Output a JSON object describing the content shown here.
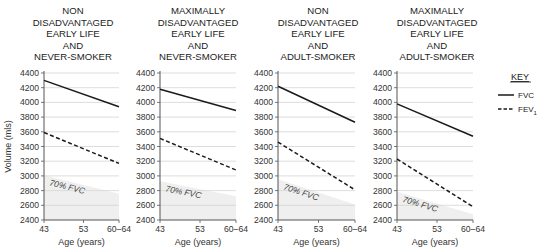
{
  "chart_data": [
    {
      "type": "line",
      "title": "NON DISADVANTAGED EARLY LIFE AND NEVER-SMOKER",
      "title_lines": [
        "NON",
        "DISADVANTAGED",
        "EARLY LIFE",
        "AND",
        "NEVER-SMOKER"
      ],
      "xlabel": "Age (years)",
      "ylabel": "Volume (mls)",
      "categories": [
        "43",
        "53",
        "60–64"
      ],
      "ylim": [
        2400,
        4400
      ],
      "yticks": [
        2400,
        2600,
        2800,
        3000,
        3200,
        3400,
        3600,
        3800,
        4000,
        4200,
        4400
      ],
      "grid": true,
      "series": [
        {
          "name": "FVC",
          "style": "solid",
          "x": [
            43,
            62
          ],
          "values": [
            4300,
            3940
          ]
        },
        {
          "name": "FEV1",
          "style": "dashed",
          "x": [
            43,
            62
          ],
          "values": [
            3590,
            3170
          ]
        }
      ],
      "shaded_region": {
        "label": "70% FVC",
        "values": [
          3010,
          2758
        ]
      }
    },
    {
      "type": "line",
      "title": "MAXIMALLY DISADVANTAGED EARLY LIFE AND NEVER-SMOKER",
      "title_lines": [
        "MAXIMALLY",
        "DISADVANTAGED",
        "EARLY LIFE",
        "AND",
        "NEVER-SMOKER"
      ],
      "xlabel": "Age (years)",
      "ylabel": "",
      "categories": [
        "43",
        "53",
        "60–64"
      ],
      "ylim": [
        2400,
        4400
      ],
      "yticks": [
        2400,
        2600,
        2800,
        3000,
        3200,
        3400,
        3600,
        3800,
        4000,
        4200,
        4400
      ],
      "grid": true,
      "series": [
        {
          "name": "FVC",
          "style": "solid",
          "x": [
            43,
            62
          ],
          "values": [
            4180,
            3890
          ]
        },
        {
          "name": "FEV1",
          "style": "dashed",
          "x": [
            43,
            62
          ],
          "values": [
            3510,
            3080
          ]
        }
      ],
      "shaded_region": {
        "label": "70% FVC",
        "values": [
          2926,
          2723
        ]
      }
    },
    {
      "type": "line",
      "title": "NON DISADVANTAGED EARLY LIFE AND ADULT-SMOKER",
      "title_lines": [
        "NON",
        "DISADVANTAGED",
        "EARLY LIFE",
        "AND",
        "ADULT-SMOKER"
      ],
      "xlabel": "Age (years)",
      "ylabel": "",
      "categories": [
        "43",
        "53",
        "60–64"
      ],
      "ylim": [
        2400,
        4400
      ],
      "yticks": [
        2400,
        2600,
        2800,
        3000,
        3200,
        3400,
        3600,
        3800,
        4000,
        4200,
        4400
      ],
      "grid": true,
      "series": [
        {
          "name": "FVC",
          "style": "solid",
          "x": [
            43,
            62
          ],
          "values": [
            4220,
            3730
          ]
        },
        {
          "name": "FEV1",
          "style": "dashed",
          "x": [
            43,
            62
          ],
          "values": [
            3460,
            2810
          ]
        }
      ],
      "shaded_region": {
        "label": "70% FVC",
        "values": [
          2954,
          2611
        ]
      }
    },
    {
      "type": "line",
      "title": "MAXIMALLY DISADVANTAGED EARLY LIFE AND ADULT-SMOKER",
      "title_lines": [
        "MAXIMALLY",
        "DISADVANTAGED",
        "EARLY LIFE",
        "AND",
        "ADULT-SMOKER"
      ],
      "xlabel": "Age (years)",
      "ylabel": "",
      "categories": [
        "43",
        "53",
        "60–64"
      ],
      "ylim": [
        2400,
        4400
      ],
      "yticks": [
        2400,
        2600,
        2800,
        3000,
        3200,
        3400,
        3600,
        3800,
        4000,
        4200,
        4400
      ],
      "grid": true,
      "series": [
        {
          "name": "FVC",
          "style": "solid",
          "x": [
            43,
            62
          ],
          "values": [
            3980,
            3540
          ]
        },
        {
          "name": "FEV1",
          "style": "dashed",
          "x": [
            43,
            62
          ],
          "values": [
            3230,
            2580
          ]
        }
      ],
      "shaded_region": {
        "label": "70% FVC",
        "values": [
          2786,
          2478
        ]
      }
    }
  ],
  "legend": {
    "title": "KEY",
    "position": "right",
    "entries": [
      {
        "label": "FVC",
        "style": "solid"
      },
      {
        "label": "FEV",
        "subscript": "1",
        "style": "dashed"
      }
    ]
  },
  "colors": {
    "line": "#1a1a1a",
    "grid": "#d4d4d4",
    "shade": "#efefef",
    "axis": "#555555"
  }
}
